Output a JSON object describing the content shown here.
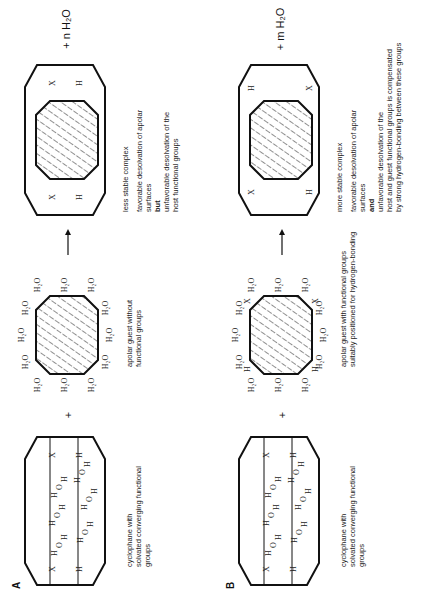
{
  "panels": {
    "A": {
      "letter": "A",
      "host_caption": [
        "cyclophane with",
        "solvated converging functional",
        "groups"
      ],
      "plus": "+",
      "guest_caption": [
        "apolar guest without",
        "functional groups"
      ],
      "product_caption_title": "less stable complex",
      "product_caption": [
        "favorable desolvation of apolar",
        "surfaces",
        "but",
        "unfavorable desolvation of  the",
        "host functional groups"
      ],
      "released": "+ n H₂O",
      "water": "H₂O"
    },
    "B": {
      "letter": "B",
      "host_caption": [
        "cyclophane with",
        "solvated converging functional",
        "groups"
      ],
      "plus": "+",
      "guest_caption": [
        "apolar guest with  functional groups",
        "suitably positioned for hydrogen-bonding"
      ],
      "product_caption_title": "more stable complex",
      "product_caption": [
        "favorable desolvation of apolar",
        "surfaces",
        "and",
        "unfavorable desolvation of  the",
        "host and guest functional groups is compensated",
        "by strong hydrogen-bonding between these groups"
      ],
      "released": "+ m H₂O",
      "water": "H₂O"
    }
  },
  "atoms": {
    "X": "X",
    "H": "H",
    "O": "O"
  },
  "arrow": "→"
}
